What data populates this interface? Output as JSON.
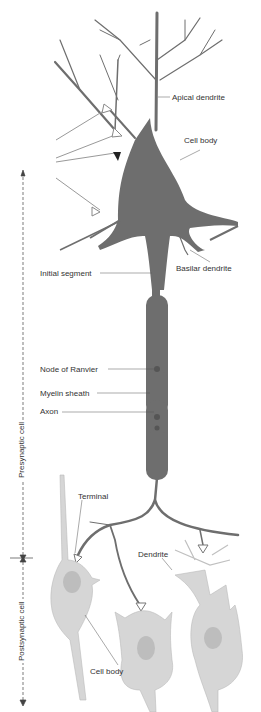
{
  "diagram": {
    "type": "neuron-anatomy",
    "colors": {
      "presynaptic_neuron": "#6e6e6e",
      "postsynaptic_cells": "#d6d6d6",
      "label_text": "#333333",
      "leader_lines": "#555555"
    },
    "labels": {
      "apical_dendrite": "Apical dendrite",
      "cell_body_top": "Cell body",
      "basilar_dendrite": "Basilar dendrite",
      "initial_segment": "Initial segment",
      "node_of_ranvier": "Node of Ranvier",
      "myelin_sheath": "Myelin sheath",
      "axon": "Axon",
      "terminal": "Terminal",
      "dendrite": "Dendrite",
      "cell_body_bottom": "Cell body"
    },
    "side_labels": {
      "presynaptic": "Presynaptic cell",
      "postsynaptic": "Postsynaptic cell"
    }
  }
}
